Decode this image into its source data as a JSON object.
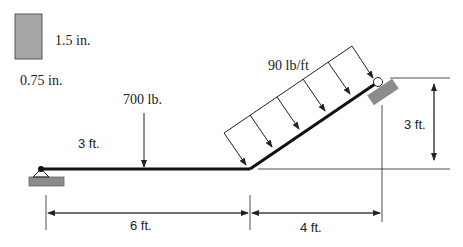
{
  "cross_section": {
    "height_label": "1.5 in.",
    "width_label": "0.75 in.",
    "fill_color": "#a6a6a6"
  },
  "loads": {
    "point_load_label": "700 lb.",
    "distributed_load_label": "90 lb/ft",
    "point_load_position_label": "3 ft."
  },
  "dimensions": {
    "horizontal_segment": "6 ft.",
    "inclined_horizontal": "4 ft.",
    "inclined_vertical": "3 ft."
  },
  "colors": {
    "beam": "#111111",
    "support": "#8c8c8c",
    "line": "#222222"
  }
}
